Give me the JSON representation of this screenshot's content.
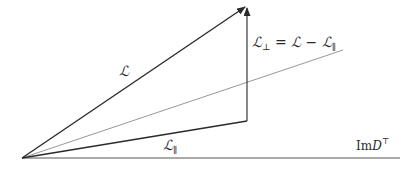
{
  "diagram": {
    "origin": {
      "x": 22,
      "y": 158
    },
    "colors": {
      "vector": "#2b2b2b",
      "thin_line": "#6a6a6a",
      "baseline": "#555555",
      "text": "#2a2a2a",
      "background": "#ffffff"
    },
    "vectors": {
      "L": {
        "label": "ℒ",
        "tip": {
          "x": 247,
          "y": 6
        }
      },
      "L_parallel": {
        "label": "ℒ",
        "subscript": "∥",
        "tip": {
          "x": 247,
          "y": 121
        }
      },
      "L_perp": {
        "label": "ℒ",
        "subscript": "⊥",
        "equation_rest": " = ℒ − ℒ",
        "equation_rest_sub": "∥",
        "from": {
          "x": 247,
          "y": 121
        },
        "to": {
          "x": 247,
          "y": 6
        }
      }
    },
    "thin_line": {
      "to": {
        "x": 343,
        "y": 50
      }
    },
    "baseline": {
      "to": {
        "x": 400,
        "y": 158
      },
      "label": "Im",
      "label_var": "D",
      "label_sup": "⊤"
    }
  }
}
